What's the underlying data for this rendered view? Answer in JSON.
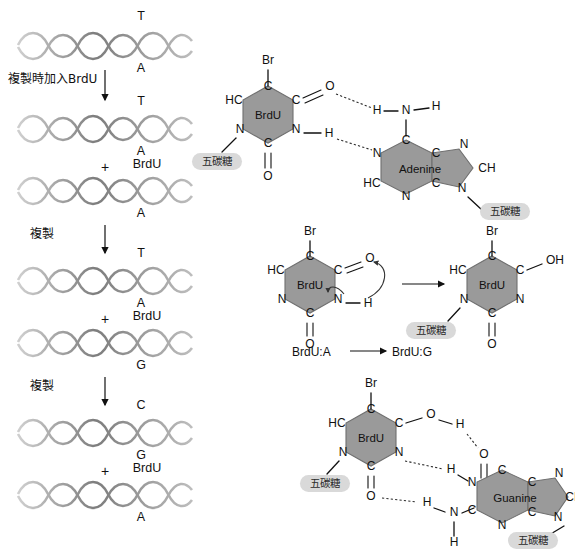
{
  "diagram": {
    "colors": {
      "ring_fill": "#9a9a9a",
      "ring_stroke": "#6f6f6f",
      "pill_fill": "#d9d9d9",
      "bond": "#111111",
      "helix": "#8f8f8f"
    }
  },
  "left_panel": {
    "rows": [
      {
        "name": "generation-0",
        "helices": [
          {
            "top_label": "T",
            "bottom_label": "A"
          }
        ]
      },
      {
        "name": "generation-1",
        "helices": [
          {
            "top_label": "T",
            "bottom_label": "A"
          },
          {
            "top_label": "BrdU",
            "bottom_label": "A"
          }
        ],
        "plus": "+"
      },
      {
        "name": "generation-2",
        "helices": [
          {
            "top_label": "T",
            "bottom_label": "A"
          },
          {
            "top_label": "BrdU",
            "bottom_label": "G"
          }
        ],
        "plus": "+"
      },
      {
        "name": "generation-3",
        "helices": [
          {
            "top_label": "C",
            "bottom_label": "G"
          },
          {
            "top_label": "BrdU",
            "bottom_label": "A"
          }
        ],
        "plus": "+"
      }
    ],
    "step_labels": [
      "複製時加入BrdU",
      "複製",
      "複製"
    ]
  },
  "pair_brdu_adenine": {
    "name": "BrdU:A base pair",
    "brdu": {
      "ring_label": "BrdU",
      "substituent_top": "Br",
      "atoms": [
        "C",
        "HC",
        "N",
        "C",
        "N",
        "C"
      ],
      "oxygens": [
        "O",
        "O"
      ],
      "hydrogens": [
        "H"
      ],
      "sugar_label": "五碳糖"
    },
    "adenine": {
      "ring_label": "Adenine",
      "atoms": [
        "C",
        "N",
        "HC",
        "N",
        "C",
        "C",
        "N",
        "CH",
        "N"
      ],
      "amine": {
        "n": "N",
        "h_left": "H",
        "h_right": "H"
      },
      "sugar_label": "五碳糖"
    },
    "hydrogen_bonds": 2
  },
  "tautomer": {
    "name": "keto to enol tautomeric shift",
    "left": {
      "ring_label": "BrdU",
      "substituent_top": "Br",
      "atoms": [
        "C",
        "HC",
        "N",
        "C",
        "N",
        "C"
      ],
      "oxygens": [
        "O",
        "O"
      ],
      "hydrogen": "H",
      "sugar_label": "五碳糖"
    },
    "right": {
      "ring_label": "BrdU",
      "substituent_top": "Br",
      "atoms": [
        "C",
        "HC",
        "N",
        "C",
        "N",
        "C"
      ],
      "enol": "OH",
      "oxygen": "O",
      "sugar_label": "五碳糖"
    },
    "caption_left": "BrdU:A",
    "caption_arrow": "→",
    "caption_right": "BrdU:G"
  },
  "pair_brdu_guanine": {
    "name": "BrdU:G base pair",
    "brdu": {
      "ring_label": "BrdU",
      "substituent_top": "Br",
      "atoms": [
        "C",
        "HC",
        "N",
        "C",
        "N",
        "C"
      ],
      "enol_oxygen": "O",
      "carbonyl_oxygen": "O",
      "sugar_label": "五碳糖"
    },
    "guanine": {
      "ring_label": "Guanine",
      "atoms": [
        "C",
        "N",
        "C",
        "N",
        "C",
        "C",
        "N",
        "CH",
        "N"
      ],
      "oxygen": "O",
      "amine_n": "N",
      "amine_h": "H",
      "nh_h": "H",
      "bridge_h": [
        "H",
        "H",
        "H"
      ],
      "sugar_label": "五碳糖"
    },
    "hydrogen_bonds": 3
  }
}
